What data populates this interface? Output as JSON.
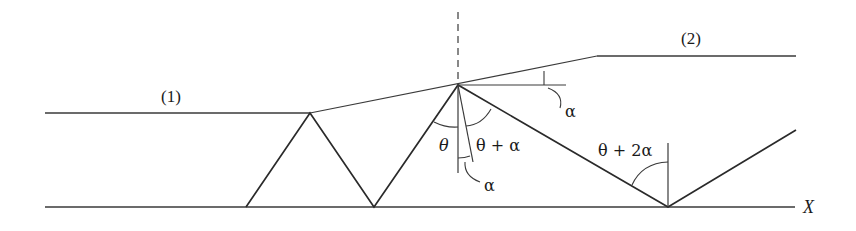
{
  "diagram": {
    "type": "ray-reflection-in-tapered-layer",
    "labels": {
      "medium_1": "(1)",
      "medium_2": "(2)",
      "axis": "X",
      "theta": "θ",
      "theta_plus_alpha": "θ + α",
      "theta_plus_2alpha": "θ + 2α",
      "alpha_top": "α",
      "alpha_bottom": "α"
    },
    "colors": {
      "line": "#2a2a2a",
      "background": "#ffffff"
    }
  }
}
